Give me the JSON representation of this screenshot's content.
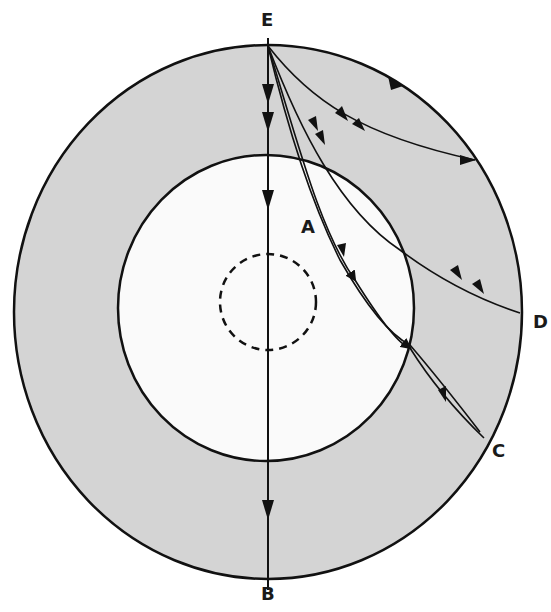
{
  "diagram": {
    "title": "",
    "colors": {
      "mantle_fill": "#d4d4d4",
      "core_fill": "#fafafa",
      "stroke": "#111111",
      "background": "#ffffff"
    },
    "labels": {
      "E": "E",
      "A": "A",
      "B": "B",
      "C": "C",
      "D": "D"
    },
    "regions": [
      {
        "id": "outer-shell",
        "description": "shaded outer layer"
      },
      {
        "id": "inner-core-boundary",
        "description": "white inner circle"
      },
      {
        "id": "inner-dashed-circle",
        "description": "dashed innermost circle"
      }
    ],
    "rays": [
      {
        "id": "ray-E-B",
        "from": "E",
        "to": "B",
        "description": "straight vertical ray through center"
      },
      {
        "id": "ray-E-C",
        "from": "E",
        "to": "C",
        "description": "curved ray refracting through core to C"
      },
      {
        "id": "ray-E-D",
        "from": "E",
        "to": "D",
        "description": "curved ray through shell to D"
      },
      {
        "id": "ray-E-shallow",
        "from": "E",
        "to": "surface",
        "description": "shallow curved ray to upper right surface"
      },
      {
        "id": "ray-E-surface",
        "from": "E",
        "to": "surface",
        "description": "arrow along outer surface"
      }
    ]
  }
}
